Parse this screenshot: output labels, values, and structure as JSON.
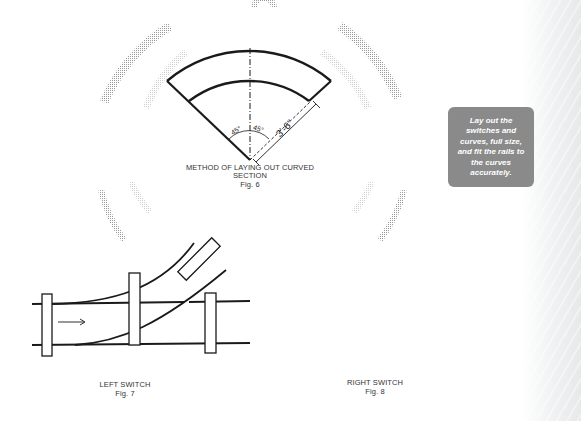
{
  "figures": {
    "fig6": {
      "title_line1": "METHOD OF LAYING OUT CURVED",
      "title_line2": "SECTION",
      "label": "Fig. 6",
      "angle_left": "45°",
      "angle_right": "45°",
      "radius_dimension": "3'-6\""
    },
    "fig7": {
      "title": "LEFT SWITCH",
      "label": "Fig. 7",
      "direction": "right-arrow"
    },
    "fig8": {
      "title": "RIGHT SWITCH",
      "label": "Fig. 8",
      "direction": "left-arrow"
    }
  },
  "callout": {
    "text": "Lay out the switches and curves, full size, and fit the rails to the curves accurately."
  },
  "colors": {
    "line": "#1a1a1a",
    "callout_bg": "#8a8a8a",
    "callout_text": "#ffffff",
    "stipple": "#b0b0b0"
  }
}
